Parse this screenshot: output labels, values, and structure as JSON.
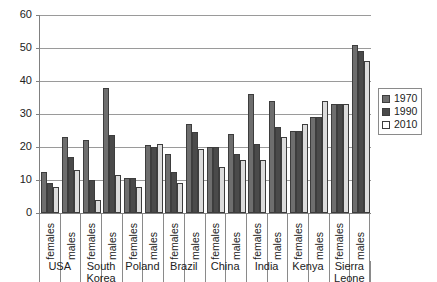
{
  "chart_data": {
    "type": "bar",
    "title": "",
    "subtitle": "",
    "xlabel": "",
    "ylabel": "",
    "ylim": [
      0,
      60
    ],
    "yticks": [
      0,
      10,
      20,
      30,
      40,
      50,
      60
    ],
    "grid": true,
    "legend_position": "right",
    "categories": [
      "USA females",
      "USA males",
      "South Korea females",
      "South Korea males",
      "Poland females",
      "Poland males",
      "Brazil females",
      "Brazil males",
      "China females",
      "China males",
      "India females",
      "India males",
      "Kenya females",
      "Kenya males",
      "Sierra Leone females",
      "Sierra Leone males"
    ],
    "countries": [
      "USA",
      "South Korea",
      "Poland",
      "Brazil",
      "China",
      "India",
      "Kenya",
      "Sierra Leone"
    ],
    "sexes": [
      "females",
      "males"
    ],
    "series": [
      {
        "name": "1970",
        "color": "#6e6e6e",
        "values": [
          12.5,
          23,
          22,
          38,
          10.5,
          20.5,
          18,
          27,
          20,
          24,
          36,
          34,
          25,
          29,
          33,
          51
        ]
      },
      {
        "name": "1990",
        "color": "#4a4a4a",
        "values": [
          9,
          17,
          10,
          23.5,
          10.5,
          20,
          12.5,
          24.5,
          20,
          18,
          21,
          26,
          25,
          29,
          33,
          49
        ]
      },
      {
        "name": "2010",
        "color": "#dcdcdc",
        "values": [
          8,
          13,
          4,
          11.5,
          8,
          21,
          9,
          19.5,
          14,
          16,
          16,
          23,
          27,
          34,
          33,
          46
        ]
      }
    ]
  },
  "legend": {
    "entries": [
      "1970",
      "1990",
      "2010"
    ]
  },
  "axis": {
    "y_tick_labels": [
      "60",
      "50",
      "40",
      "30",
      "20",
      "10",
      "0"
    ]
  },
  "colors": {
    "series_1970": "#6e6e6e",
    "series_1990": "#4a4a4a",
    "series_2010": "#dcdcdc",
    "grid": "#9a9a9a",
    "axis": "#808080",
    "text": "#222222"
  }
}
